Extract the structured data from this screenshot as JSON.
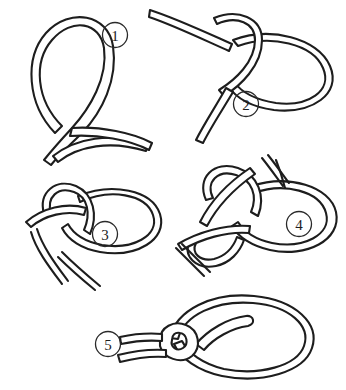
{
  "figure": {
    "background_color": "#ffffff",
    "line_color": "#1d1d1d",
    "rope_fill_color": "#ffffff",
    "style": "black and white line drawing",
    "width": 346,
    "height": 390
  },
  "steps": [
    {
      "number": "1",
      "label_x": 115,
      "label_y": 35,
      "description": "A loop is formed in the rope with the standing part crossing over itself"
    },
    {
      "number": "2",
      "label_x": 246,
      "label_y": 104,
      "description": "The working end is passed up through the loop"
    },
    {
      "number": "3",
      "label_x": 105,
      "label_y": 234,
      "description": "The working end is brought around behind the standing part"
    },
    {
      "number": "4",
      "label_x": 299,
      "label_y": 224,
      "description": "The working end is passed back down through the loop"
    },
    {
      "number": "5",
      "label_x": 108,
      "label_y": 344,
      "description": "The knot is drawn tight leaving a fixed loop"
    }
  ]
}
